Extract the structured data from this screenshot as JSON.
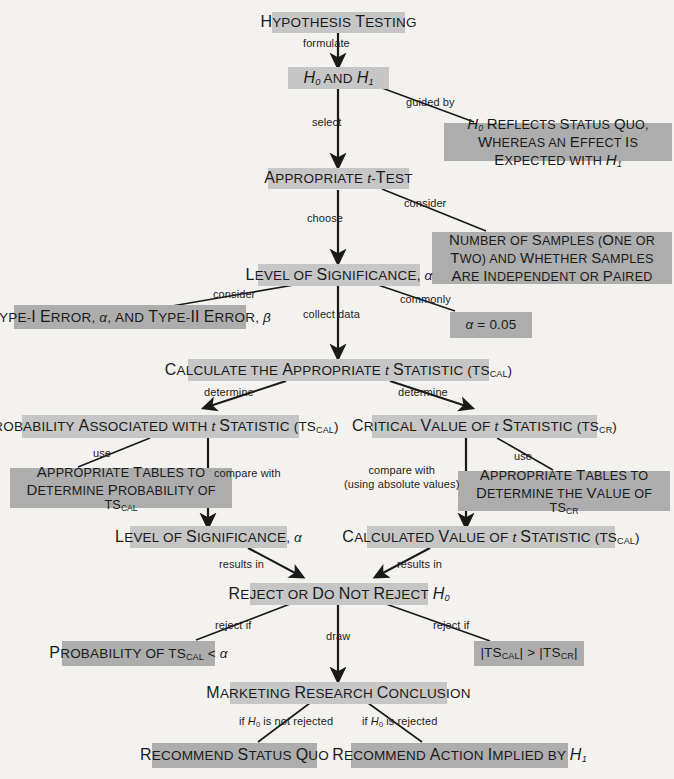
{
  "diagram": {
    "colors": {
      "background": "#f4f2ef",
      "main_box": "#c6c6c6",
      "note_box": "#adadad",
      "text": "#1b1b1b",
      "connector": "#1a1a1a"
    },
    "nodes": [
      {
        "id": "hypothesis_testing",
        "kind": "main",
        "text": "Hypothesis Testing"
      },
      {
        "id": "h0_and_h1",
        "kind": "main",
        "text": "H0 and H1"
      },
      {
        "id": "h0_reflects_status_quo",
        "kind": "note",
        "text": "H0 Reflects Status Quo, Whereas an Effect Is Expected with H1"
      },
      {
        "id": "appropriate_t_test",
        "kind": "main",
        "text": "Appropriate t-Test"
      },
      {
        "id": "number_of_samples",
        "kind": "note",
        "text": "Number of Samples (One or Two) and Whether Samples Are Independent or Paired"
      },
      {
        "id": "level_of_significance_1",
        "kind": "main",
        "text": "Level of Significance, α"
      },
      {
        "id": "type_i_type_ii_error",
        "kind": "note",
        "text": "Type-I Error, α, and Type-II Error, β"
      },
      {
        "id": "alpha_value",
        "kind": "note",
        "text": "α = 0.05"
      },
      {
        "id": "calculate_ts_cal",
        "kind": "main",
        "text": "Calculate the Appropriate t Statistic (TSCAL)"
      },
      {
        "id": "probability_ts_cal",
        "kind": "main",
        "text": "Probability Associated with t Statistic (TSCAL)"
      },
      {
        "id": "critical_value_ts_cr",
        "kind": "main",
        "text": "Critical Value of t Statistic (TSCR)"
      },
      {
        "id": "tables_probability_ts_cal",
        "kind": "note",
        "text": "Appropriate Tables to Determine Probability of TSCAL"
      },
      {
        "id": "tables_value_ts_cr",
        "kind": "note",
        "text": "Appropriate Tables to Determine the Value of TSCR"
      },
      {
        "id": "level_of_significance_2",
        "kind": "main",
        "text": "Level of Significance, α"
      },
      {
        "id": "calculated_value_ts_cal",
        "kind": "main",
        "text": "Calculated Value of t Statistic (TSCAL)"
      },
      {
        "id": "reject_or_not",
        "kind": "main",
        "text": "Reject or Do Not Reject H0"
      },
      {
        "id": "probability_less_alpha",
        "kind": "note",
        "text": "Probability of TSCAL < α"
      },
      {
        "id": "abs_ts_cal_gt_ts_cr",
        "kind": "note",
        "text": "|TSCAL| > |TSCR|"
      },
      {
        "id": "marketing_conclusion",
        "kind": "main",
        "text": "Marketing Research Conclusion"
      },
      {
        "id": "recommend_status_quo",
        "kind": "note",
        "text": "Recommend Status Quo"
      },
      {
        "id": "recommend_action_h1",
        "kind": "note",
        "text": "Recommend Action Implied by H1"
      }
    ],
    "edge_labels": [
      {
        "id": "formulate",
        "text": "formulate"
      },
      {
        "id": "guided_by",
        "text": "guided by"
      },
      {
        "id": "select",
        "text": "select"
      },
      {
        "id": "consider_samples",
        "text": "consider"
      },
      {
        "id": "choose",
        "text": "choose"
      },
      {
        "id": "consider_errors",
        "text": "consider"
      },
      {
        "id": "collect_data",
        "text": "collect data"
      },
      {
        "id": "commonly",
        "text": "commonly"
      },
      {
        "id": "determine_left",
        "text": "determine"
      },
      {
        "id": "determine_right",
        "text": "determine"
      },
      {
        "id": "use_left",
        "text": "use"
      },
      {
        "id": "use_right",
        "text": "use"
      },
      {
        "id": "compare_with_left",
        "text": "compare with"
      },
      {
        "id": "compare_with_right_1",
        "text": "compare with"
      },
      {
        "id": "compare_with_right_2",
        "text": "(using absolute values)"
      },
      {
        "id": "results_in_left",
        "text": "results in"
      },
      {
        "id": "results_in_right",
        "text": "results in"
      },
      {
        "id": "reject_if_left",
        "text": "reject if"
      },
      {
        "id": "draw",
        "text": "draw"
      },
      {
        "id": "reject_if_right",
        "text": "reject if"
      },
      {
        "id": "if_h0_not_rejected",
        "text": "if H0 is not rejected"
      },
      {
        "id": "if_h0_rejected",
        "text": "if H0 is rejected"
      }
    ]
  }
}
